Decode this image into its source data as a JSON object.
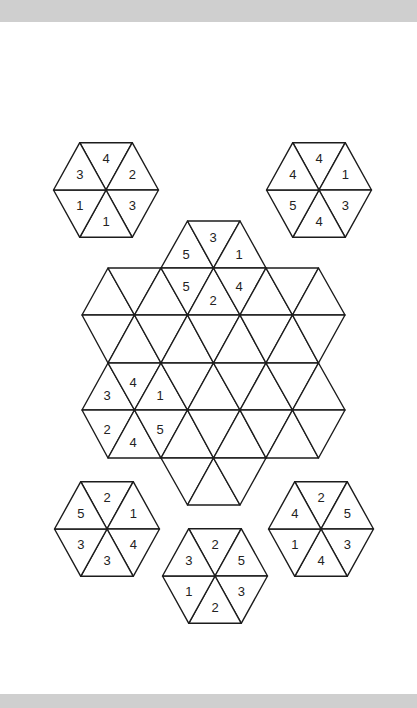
{
  "colors": {
    "background": "#ffffff",
    "band": "#cfcfcf",
    "line": "#1c1c1c",
    "text": "#222222"
  },
  "geometry": {
    "side": 52.5,
    "row_height": 47.3
  },
  "pieces": [
    {
      "id": "piece-top-left",
      "center": [
        106,
        190
      ],
      "values": [
        "4",
        "2",
        "3",
        "1",
        "1",
        "3"
      ]
    },
    {
      "id": "piece-top-right",
      "center": [
        319,
        190
      ],
      "values": [
        "4",
        "1",
        "3",
        "4",
        "5",
        "4"
      ]
    },
    {
      "id": "piece-bottom-left",
      "center": [
        107,
        529
      ],
      "values": [
        "2",
        "1",
        "4",
        "3",
        "3",
        "5"
      ]
    },
    {
      "id": "piece-bottom-center",
      "center": [
        215,
        576
      ],
      "values": [
        "2",
        "5",
        "3",
        "2",
        "1",
        "3"
      ]
    },
    {
      "id": "piece-bottom-right",
      "center": [
        321,
        529
      ],
      "values": [
        "2",
        "5",
        "3",
        "4",
        "1",
        "4"
      ]
    }
  ],
  "board": {
    "rows": [
      {
        "y_top": 221,
        "y_bot": 268,
        "top_x": [
          187.5,
          240
        ],
        "bot_x": [
          161,
          213.5,
          266
        ]
      },
      {
        "y_top": 268,
        "y_bot": 315,
        "top_x": [
          108,
          161,
          213.5,
          266,
          318.5
        ],
        "bot_x": [
          82,
          134.5,
          187.5,
          240,
          292.5,
          345
        ]
      },
      {
        "y_top": 315,
        "y_bot": 363,
        "top_x": [
          82,
          134.5,
          187.5,
          240,
          292.5,
          345
        ],
        "bot_x": [
          108,
          161,
          213.5,
          266,
          318.5
        ]
      },
      {
        "y_top": 363,
        "y_bot": 410,
        "top_x": [
          108,
          161,
          213.5,
          266,
          318.5
        ],
        "bot_x": [
          82,
          134.5,
          187.5,
          240,
          292.5,
          345
        ]
      },
      {
        "y_top": 410,
        "y_bot": 458,
        "top_x": [
          82,
          134.5,
          187.5,
          240,
          292.5,
          345
        ],
        "bot_x": [
          108,
          161,
          213.5,
          266,
          318.5
        ]
      },
      {
        "y_top": 458,
        "y_bot": 505,
        "top_x": [
          161,
          213.5,
          266
        ],
        "bot_x": [
          187.5,
          240
        ]
      }
    ],
    "numbers": [
      {
        "x": 186,
        "y": 254,
        "v": "5"
      },
      {
        "x": 213,
        "y": 237,
        "v": "3"
      },
      {
        "x": 239,
        "y": 254,
        "v": "1"
      },
      {
        "x": 186,
        "y": 286,
        "v": "5"
      },
      {
        "x": 213,
        "y": 300,
        "v": "2"
      },
      {
        "x": 239,
        "y": 286,
        "v": "4"
      },
      {
        "x": 107,
        "y": 395,
        "v": "3"
      },
      {
        "x": 133,
        "y": 382,
        "v": "4"
      },
      {
        "x": 160,
        "y": 395,
        "v": "1"
      },
      {
        "x": 107,
        "y": 429,
        "v": "2"
      },
      {
        "x": 133,
        "y": 442,
        "v": "4"
      },
      {
        "x": 160,
        "y": 429,
        "v": "5"
      }
    ]
  }
}
